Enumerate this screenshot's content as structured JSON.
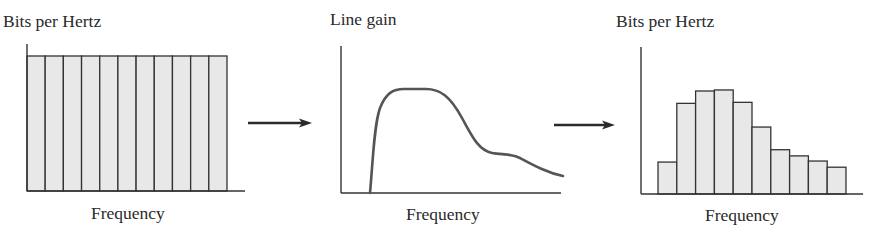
{
  "panels": [
    {
      "id": "input-bit-allocation",
      "ylabel": "Bits per Hertz",
      "xlabel": "Frequency"
    },
    {
      "id": "line-gain",
      "ylabel": "Line gain",
      "xlabel": "Frequency"
    },
    {
      "id": "output-bit-allocation",
      "ylabel": "Bits per Hertz",
      "xlabel": "Frequency"
    }
  ],
  "colors": {
    "bar_fill": "#e8e8e8",
    "bar_stroke": "#333333",
    "axis": "#333333",
    "curve": "#555555",
    "arrow": "#2a2a2a"
  },
  "chart_data": [
    {
      "type": "bar",
      "title": "",
      "xlabel": "Frequency",
      "ylabel": "Bits per Hertz",
      "categories": [
        "1",
        "2",
        "3",
        "4",
        "5",
        "6",
        "7",
        "8",
        "9",
        "10",
        "11"
      ],
      "values": [
        1,
        1,
        1,
        1,
        1,
        1,
        1,
        1,
        1,
        1,
        1
      ],
      "ylim": [
        0,
        1.1
      ],
      "grid": false,
      "note": "Uniform bit allocation across 11 frequency sub-bands (relative units)"
    },
    {
      "type": "line",
      "title": "",
      "xlabel": "Frequency",
      "ylabel": "Line gain",
      "x": [
        0.0,
        0.13,
        0.16,
        0.2,
        0.27,
        0.4,
        0.48,
        0.56,
        0.64,
        0.76,
        0.88,
        1.0
      ],
      "values": [
        0.0,
        0.0,
        0.55,
        0.88,
        1.0,
        1.0,
        0.9,
        0.6,
        0.37,
        0.34,
        0.22,
        0.16
      ],
      "ylim": [
        0,
        1.1
      ],
      "grid": false,
      "note": "Qualitative line gain curve (relative units); no tick labels shown"
    },
    {
      "type": "bar",
      "title": "",
      "xlabel": "Frequency",
      "ylabel": "Bits per Hertz",
      "categories": [
        "1",
        "2",
        "3",
        "4",
        "5",
        "6",
        "7",
        "8",
        "9",
        "10"
      ],
      "values": [
        0.31,
        0.88,
        1.0,
        1.01,
        0.89,
        0.65,
        0.43,
        0.37,
        0.32,
        0.26
      ],
      "ylim": [
        0,
        1.4
      ],
      "grid": false,
      "note": "Adapted bit allocation following the line gain (relative units)"
    }
  ]
}
